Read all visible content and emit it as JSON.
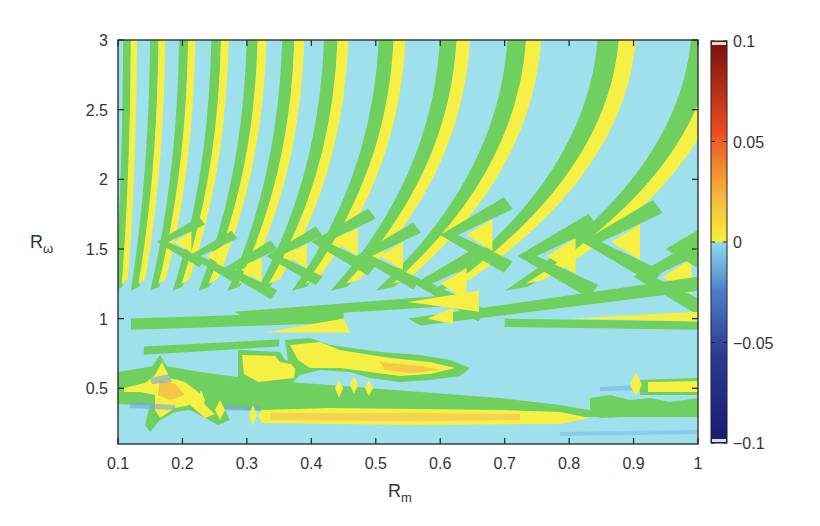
{
  "chart_data": {
    "type": "heatmap",
    "subtype": "filled-contour",
    "title": "",
    "xlabel": "R",
    "xlabel_subscript": "m",
    "ylabel": "R",
    "ylabel_subscript": "ω",
    "xlim": [
      0.1,
      1.0
    ],
    "ylim": [
      0.1,
      3.0
    ],
    "x_ticks": [
      "0.1",
      "0.2",
      "0.3",
      "0.4",
      "0.5",
      "0.6",
      "0.7",
      "0.8",
      "0.9",
      "1"
    ],
    "y_ticks": [
      "0.5",
      "1",
      "1.5",
      "2",
      "2.5",
      "3"
    ],
    "grid": false,
    "colorbar": {
      "position": "right",
      "range": [
        -0.1,
        0.1
      ],
      "ticks": [
        "0.1",
        "0.05",
        "0",
        "−0.05",
        "−0.1"
      ],
      "colormap": "jet",
      "stops": [
        {
          "value": -0.1,
          "color": "#1a1a6e"
        },
        {
          "value": -0.05,
          "color": "#2b3f9a"
        },
        {
          "value": -0.02,
          "color": "#5a9ad8"
        },
        {
          "value": 0.0,
          "color": "#8fdcec"
        },
        {
          "value": 0.0,
          "color": "#f6f13a"
        },
        {
          "value": 0.03,
          "color": "#f2a83a"
        },
        {
          "value": 0.06,
          "color": "#e8491e"
        },
        {
          "value": 0.1,
          "color": "#7a1010"
        }
      ]
    },
    "field_levels": {
      "background_cyan": "#9ee0ec",
      "contour_green": "#6fcf5f",
      "positive_yellow": "#f7f044",
      "weak_orange": "#f0b24a",
      "weak_blue": "#6fa9e6"
    }
  }
}
